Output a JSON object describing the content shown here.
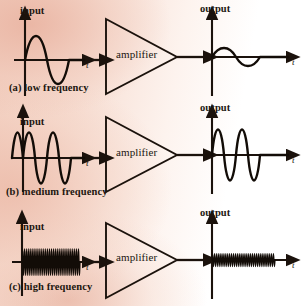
{
  "figure": {
    "ink_color": "#1b120c",
    "background_color": "#f3d6c8",
    "t_axis_label": "t"
  },
  "labels": {
    "input": "input",
    "output": "output",
    "amplifier": "amplifier",
    "time_axis": "t"
  },
  "panels": [
    {
      "id": "a",
      "caption": "(a) low frequency",
      "input_label": "input",
      "output_label": "output",
      "block_label": "amplifier",
      "input_t_label": "t",
      "output_t_label": "t",
      "input_cycles": 1,
      "output_cycles": 1,
      "input_amplitude": 26,
      "output_amplitude": 9,
      "gain_note": "reduced"
    },
    {
      "id": "b",
      "caption": "(b) medium frequency",
      "input_label": "input",
      "output_label": "output",
      "block_label": "amplifier",
      "input_t_label": "t",
      "output_t_label": "t",
      "input_cycles": 4,
      "output_cycles": 4,
      "input_amplitude": 28,
      "output_amplitude": 28,
      "gain_note": "full"
    },
    {
      "id": "c",
      "caption": "(c) high frequency",
      "input_label": "input",
      "output_label": "output",
      "block_label": "amplifier",
      "input_t_label": "t",
      "output_t_label": "t",
      "input_cycles": 30,
      "output_cycles": 30,
      "input_amplitude": 27,
      "output_amplitude": 13,
      "gain_note": "reduced"
    }
  ],
  "chart_data": {
    "type": "line",
    "xlabel": "t",
    "ylabel": "",
    "series": [
      {
        "name": "(a) low frequency input",
        "cycles": 1,
        "amplitude": 26
      },
      {
        "name": "(a) low frequency output",
        "cycles": 1,
        "amplitude": 9
      },
      {
        "name": "(b) medium frequency input",
        "cycles": 4,
        "amplitude": 28
      },
      {
        "name": "(b) medium frequency output",
        "cycles": 4,
        "amplitude": 28
      },
      {
        "name": "(c) high frequency input",
        "cycles": 30,
        "amplitude": 27
      },
      {
        "name": "(c) high frequency output",
        "cycles": 30,
        "amplitude": 13
      }
    ]
  }
}
